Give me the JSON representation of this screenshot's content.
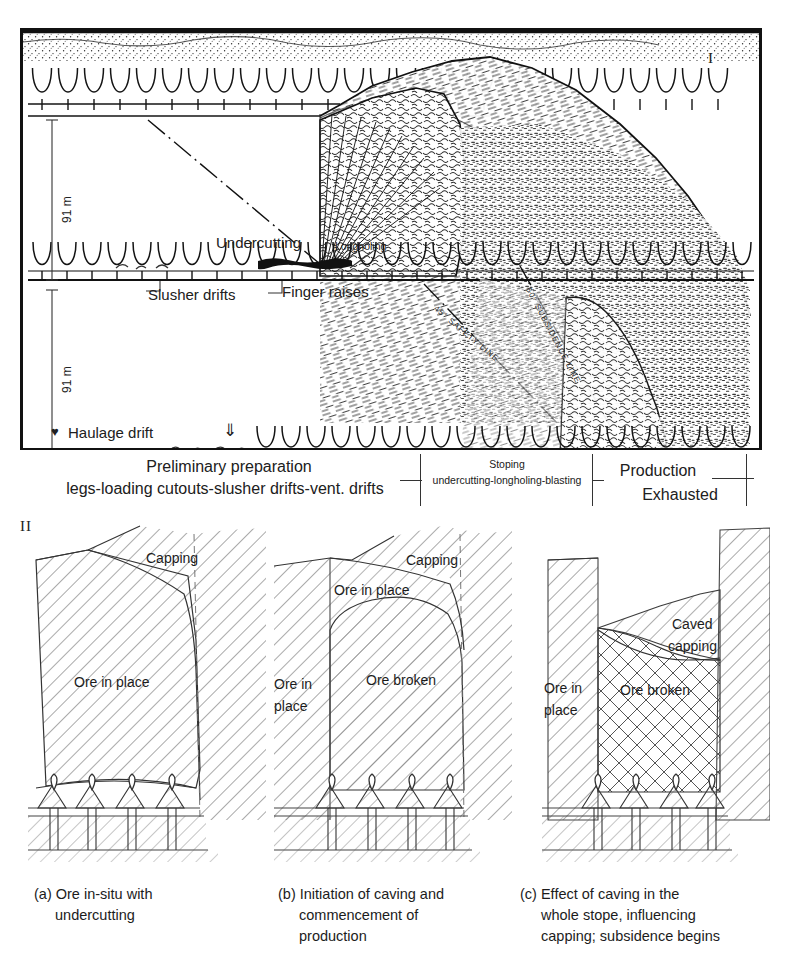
{
  "figure": {
    "panel_one_marker": "I",
    "panel_two_marker": "II"
  },
  "panel_one": {
    "dimensions": [
      {
        "name": "upper-level-height",
        "value": "91 m"
      },
      {
        "name": "lower-level-height",
        "value": "91 m"
      }
    ],
    "labels": {
      "undercutting": "Undercutting",
      "longholing": "Longholing",
      "slusher_drifts": "Slusher drifts",
      "finger_raises": "Finger raises",
      "haulage_drift": "Haulage drift",
      "heart_symbol": "♥",
      "down_arrow_symbol": "⇓"
    },
    "annotations": {
      "safety_line": "45° SAFETY LINE",
      "subsidence_line": "60° SUBSIDENCE LINE"
    },
    "caption_band": {
      "preliminary_line1": "Preliminary preparation",
      "preliminary_line2": "legs-loading cutouts-slusher drifts-vent. drifts",
      "stoping_line1": "Stoping",
      "stoping_line2": "undercutting-longholing-blasting",
      "production": "Production",
      "exhausted": "Exhausted"
    }
  },
  "panel_two": {
    "sub_a": {
      "labels": [
        {
          "name": "capping",
          "text": "Capping"
        },
        {
          "name": "ore-in-place",
          "text": "Ore in place"
        }
      ],
      "caption_index": "(a)",
      "caption_line1": "Ore in-situ with",
      "caption_line2": "undercutting"
    },
    "sub_b": {
      "labels": [
        {
          "name": "capping",
          "text": "Capping"
        },
        {
          "name": "ore-in-place-top",
          "text": "Ore in place"
        },
        {
          "name": "ore-in-place-left-1",
          "text": "Ore in"
        },
        {
          "name": "ore-in-place-left-2",
          "text": "place"
        },
        {
          "name": "ore-broken",
          "text": "Ore broken"
        }
      ],
      "caption_index": "(b)",
      "caption_line1": "Initiation of caving and",
      "caption_line2": "commencement of",
      "caption_line3": "production"
    },
    "sub_c": {
      "labels": [
        {
          "name": "ore-in-place-1",
          "text": "Ore in"
        },
        {
          "name": "ore-in-place-2",
          "text": "place"
        },
        {
          "name": "caved-capping-1",
          "text": "Caved"
        },
        {
          "name": "caved-capping-2",
          "text": "capping"
        },
        {
          "name": "ore-broken",
          "text": "Ore broken"
        }
      ],
      "caption_index": "(c)",
      "caption_line1": "Effect of caving in the",
      "caption_line2": "whole stope, influencing",
      "caption_line3": "capping; subsidence begins"
    }
  },
  "colors": {
    "ink": "#1a1a1a",
    "hatch": "#4a4a4a",
    "frame": "#111111",
    "background": "#ffffff"
  }
}
